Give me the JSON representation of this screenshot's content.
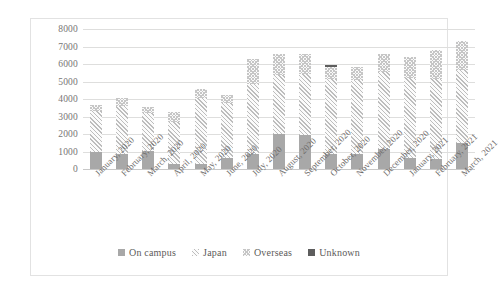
{
  "chart_data": {
    "type": "bar",
    "stacked": true,
    "title": "",
    "xlabel": "",
    "ylabel": "",
    "ylim": [
      0,
      8000
    ],
    "ytick_step": 1000,
    "yticks": [
      "8000",
      "7000",
      "6000",
      "5000",
      "4000",
      "3000",
      "2000",
      "1000",
      "0"
    ],
    "grid": true,
    "legend_position": "bottom",
    "categories": [
      "January, 2020",
      "February, 2020",
      "March, 2020",
      "April, 2020",
      "May, 2020",
      "June, 2020",
      "July, 2020",
      "August, 2020",
      "September, 2020",
      "October, 2020",
      "November, 2020",
      "December, 2020",
      "January, 2021",
      "February, 2021",
      "March, 2021"
    ],
    "series": [
      {
        "name": "On campus",
        "fill": "solid-gray",
        "color": "#a8a8a8",
        "values": [
          950,
          880,
          1020,
          300,
          300,
          640,
          860,
          1980,
          1930,
          860,
          880,
          1120,
          620,
          550,
          1480
        ]
      },
      {
        "name": "Japan",
        "fill": "diagonal-hatch",
        "color": "#bdbdbd",
        "values": [
          2340,
          2740,
          2180,
          2390,
          3760,
          3130,
          4000,
          3420,
          3480,
          4290,
          4180,
          4400,
          4570,
          4600,
          4150
        ]
      },
      {
        "name": "Overseas",
        "fill": "dotted-crosshatch",
        "color": "#c6c6c6",
        "values": [
          360,
          430,
          350,
          560,
          490,
          480,
          1440,
          1200,
          1140,
          660,
          790,
          1030,
          1210,
          1650,
          1670
        ]
      },
      {
        "name": "Unknown",
        "fill": "solid-dark",
        "color": "#5d5d5d",
        "values": [
          0,
          0,
          0,
          0,
          0,
          0,
          0,
          0,
          0,
          140,
          0,
          0,
          0,
          0,
          0
        ]
      }
    ],
    "totals": [
      3650,
      4050,
      3550,
      3250,
      4550,
      4250,
      6300,
      6600,
      6550,
      5950,
      5850,
      6550,
      6400,
      6800,
      7300
    ]
  },
  "legend": {
    "items": [
      {
        "label": "On campus"
      },
      {
        "label": "Japan"
      },
      {
        "label": "Overseas"
      },
      {
        "label": "Unknown"
      }
    ]
  }
}
